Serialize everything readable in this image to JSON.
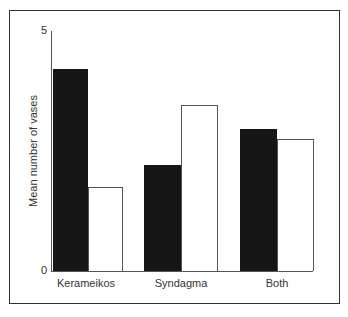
{
  "chart_data": {
    "type": "bar",
    "title": "",
    "xlabel": "",
    "ylabel": "Mean number of vases",
    "ylim": [
      0,
      5
    ],
    "yticks": [
      "0",
      "5"
    ],
    "grid": false,
    "legend": null,
    "categories": [
      "Kerameikos",
      "Syndagma",
      "Both"
    ],
    "series": [
      {
        "name": "black bars",
        "color": "#161616",
        "values": [
          4.2,
          2.2,
          2.95
        ]
      },
      {
        "name": "white bars",
        "color": "#ffffff",
        "values": [
          1.75,
          3.45,
          2.75
        ]
      }
    ]
  }
}
